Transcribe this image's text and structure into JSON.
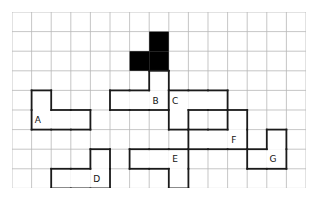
{
  "canvas": {
    "width": 318,
    "height": 199,
    "background": "#ffffff"
  },
  "grid": {
    "origin_x": 12,
    "origin_y": 12,
    "cols": 15,
    "rows": 9,
    "cell": 19.6,
    "line_color": "#b7b7b7",
    "line_width": 0.8,
    "border_color": "#b7b7b7",
    "visible": true
  },
  "style": {
    "shape_outline_color": "#1a1a1a",
    "shape_outline_width": 1.8,
    "shape_fill": "#ffffff",
    "target_fill": "#000000",
    "label_color": "#111111",
    "label_font_size": 9
  },
  "shapes": [
    {
      "id": "target",
      "label": "",
      "kind": "target-piece",
      "filled": true,
      "fill": "#000000",
      "cells": [
        [
          7,
          1
        ],
        [
          6,
          2
        ],
        [
          7,
          2
        ]
      ],
      "label_cell": null
    },
    {
      "id": "A",
      "label": "A",
      "kind": "candidate-piece",
      "filled": false,
      "fill": "#ffffff",
      "cells": [
        [
          1,
          4
        ],
        [
          1,
          5
        ],
        [
          2,
          5
        ],
        [
          3,
          5
        ]
      ],
      "label_cell": [
        1,
        5
      ]
    },
    {
      "id": "B",
      "label": "B",
      "kind": "candidate-piece",
      "filled": false,
      "fill": "#ffffff",
      "cells": [
        [
          7,
          3
        ],
        [
          5,
          4
        ],
        [
          6,
          4
        ],
        [
          7,
          4
        ]
      ],
      "label_cell": [
        7,
        4
      ]
    },
    {
      "id": "C",
      "label": "C",
      "kind": "candidate-piece",
      "filled": false,
      "fill": "#ffffff",
      "cells": [
        [
          8,
          4
        ],
        [
          9,
          4
        ],
        [
          10,
          4
        ],
        [
          8,
          5
        ]
      ],
      "label_cell": [
        8,
        4
      ]
    },
    {
      "id": "D",
      "label": "D",
      "kind": "candidate-piece",
      "filled": false,
      "fill": "#ffffff",
      "cells": [
        [
          4,
          7
        ],
        [
          2,
          8
        ],
        [
          3,
          8
        ],
        [
          4,
          8
        ]
      ],
      "label_cell": [
        4,
        8
      ]
    },
    {
      "id": "E",
      "label": "E",
      "kind": "candidate-piece",
      "filled": false,
      "fill": "#ffffff",
      "cells": [
        [
          6,
          7
        ],
        [
          7,
          7
        ],
        [
          8,
          7
        ],
        [
          8,
          8
        ]
      ],
      "label_cell": [
        8,
        7
      ]
    },
    {
      "id": "F",
      "label": "F",
      "kind": "candidate-piece",
      "filled": false,
      "fill": "#ffffff",
      "cells": [
        [
          11,
          5
        ],
        [
          9,
          6
        ],
        [
          10,
          6
        ],
        [
          11,
          6
        ]
      ],
      "label_cell": [
        11,
        6
      ]
    },
    {
      "id": "G",
      "label": "G",
      "kind": "candidate-piece",
      "filled": false,
      "fill": "#ffffff",
      "cells": [
        [
          13,
          6
        ],
        [
          13,
          7
        ],
        [
          12,
          7
        ]
      ],
      "label_cell": [
        13,
        7
      ]
    }
  ],
  "labels": {
    "A": "A",
    "B": "B",
    "C": "C",
    "D": "D",
    "E": "E",
    "F": "F",
    "G": "G"
  }
}
